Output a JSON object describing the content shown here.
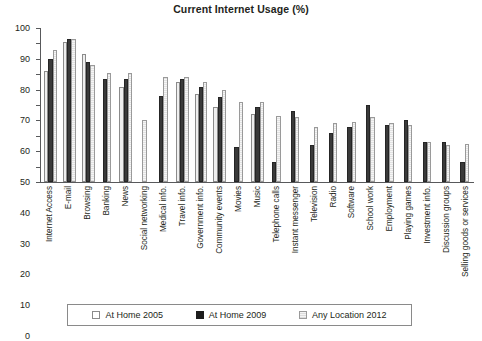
{
  "chart_data": {
    "type": "bar",
    "title": "Current Internet Usage (%)",
    "xlabel": "",
    "ylabel": "",
    "ylim": [
      0,
      100
    ],
    "yticks": [
      0,
      10,
      20,
      30,
      40,
      50,
      60,
      70,
      80,
      90,
      100
    ],
    "grid": false,
    "legend_position": "bottom",
    "categories": [
      "Internet Access",
      "E-mail",
      "Browsing",
      "Banking",
      "News",
      "Social networking",
      "Medical info.",
      "Travel info.",
      "Government info.",
      "Community events",
      "Movies",
      "Music",
      "Telephone calls",
      "Instant messenger",
      "Television",
      "Radio",
      "Software",
      "School work",
      "Employment",
      "Playing games",
      "Investment info.",
      "Discussion groups",
      "Selling goods or services"
    ],
    "series": [
      {
        "name": "At Home 2005",
        "color": "#efefef",
        "values": [
          72,
          91,
          83,
          null,
          62,
          null,
          null,
          65,
          57,
          49,
          null,
          44,
          null,
          null,
          null,
          null,
          null,
          null,
          null,
          null,
          null,
          null,
          null
        ]
      },
      {
        "name": "At Home 2009",
        "color": "#3a3a3a",
        "values": [
          80,
          93,
          78,
          67,
          67,
          null,
          56,
          67,
          62,
          55,
          23,
          49,
          13,
          46,
          24,
          32,
          36,
          50,
          37,
          40,
          26,
          26,
          13
        ]
      },
      {
        "name": "Any Location 2012",
        "color": "#e8e8e8",
        "values": [
          86,
          93,
          76,
          71,
          71,
          40,
          68,
          68,
          65,
          60,
          52,
          52,
          43,
          42,
          36,
          38,
          39,
          42,
          38,
          37,
          26,
          24,
          25
        ]
      }
    ]
  },
  "legend": {
    "items": [
      {
        "label": "At Home 2005"
      },
      {
        "label": "At Home 2009"
      },
      {
        "label": "Any Location 2012"
      }
    ]
  }
}
